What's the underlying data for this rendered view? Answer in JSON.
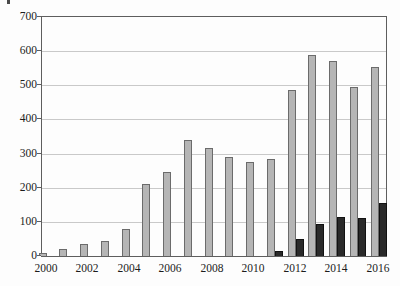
{
  "chart_data": {
    "type": "bar",
    "title": "",
    "xlabel": "",
    "ylabel": "",
    "categories": [
      "2000",
      "2001",
      "2002",
      "2003",
      "2004",
      "2005",
      "2006",
      "2007",
      "2008",
      "2009",
      "2010",
      "2011",
      "2012",
      "2013",
      "2014",
      "2015",
      "2016"
    ],
    "series": [
      {
        "name": "gray-series",
        "color": "#b5b5b5",
        "border_color": "#6b6b6b",
        "values": [
          10,
          20,
          35,
          45,
          80,
          210,
          245,
          340,
          315,
          290,
          275,
          285,
          485,
          590,
          570,
          495,
          555
        ]
      },
      {
        "name": "black-series",
        "color": "#2a2a2a",
        "border_color": "#121212",
        "values": [
          0,
          0,
          0,
          0,
          0,
          0,
          0,
          0,
          0,
          0,
          0,
          15,
          50,
          95,
          115,
          110,
          155
        ]
      }
    ],
    "ylim": [
      0,
      700
    ],
    "ytick_interval": 100,
    "ytick_labels": [
      "0",
      "100",
      "200",
      "300",
      "400",
      "500",
      "600",
      "700"
    ],
    "xtick_labels": [
      "2000",
      "2002",
      "2004",
      "2006",
      "2008",
      "2010",
      "2012",
      "2014",
      "2016"
    ],
    "grid": "horizontal",
    "legend": "none",
    "axis_color": "#5e5e5e",
    "gridline_color": "#c9c9c9",
    "background_color": "#fdfdfd"
  }
}
